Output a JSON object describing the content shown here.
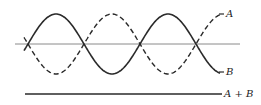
{
  "diagram": {
    "waves": [
      {
        "name": "A",
        "style": "dashed",
        "phase_deg": 180,
        "label": "A"
      },
      {
        "name": "B",
        "style": "solid",
        "phase_deg": 0,
        "label": "B"
      }
    ],
    "cycles_shown": 2.5,
    "sum": {
      "label": "A + B",
      "amplitude": 0
    },
    "colors": {
      "stroke": "#2a2a2a",
      "axis": "#8a8a8a"
    }
  }
}
